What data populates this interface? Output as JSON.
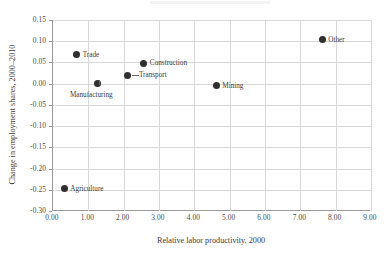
{
  "chart_data": {
    "type": "scatter",
    "title": "",
    "xlabel": "Relative labor productivity, 2000",
    "ylabel": "Change in employment shares, 2000–2010",
    "xlim": [
      0.0,
      9.0
    ],
    "ylim": [
      -0.3,
      0.15
    ],
    "xticks": [
      "0.00",
      "1.00",
      "2.00",
      "3.00",
      "4.00",
      "5.00",
      "6.00",
      "7.00",
      "8.00",
      "9.00"
    ],
    "xtick_values": [
      0,
      1,
      2,
      3,
      4,
      5,
      6,
      7,
      8,
      9
    ],
    "yticks": [
      "0.15",
      "0.10",
      "0.05",
      "0.00",
      "-0.05",
      "-0.10",
      "-0.15",
      "-0.20",
      "-0.25",
      "-0.30"
    ],
    "ytick_values": [
      0.15,
      0.1,
      0.05,
      0.0,
      -0.05,
      -0.1,
      -0.15,
      -0.2,
      -0.25,
      -0.3
    ],
    "grid": true,
    "legend": "none",
    "marker_color": "#2f2f2f",
    "points": [
      {
        "label": "Agriculture",
        "x": 0.35,
        "y": -0.248,
        "label_pos": "right"
      },
      {
        "label": "Trade",
        "x": 0.7,
        "y": 0.068,
        "label_pos": "right"
      },
      {
        "label": "Manufacturing",
        "x": 1.3,
        "y": 0.0,
        "label_pos": "below"
      },
      {
        "label": "Transport",
        "x": 2.15,
        "y": 0.02,
        "label_pos": "right-leader"
      },
      {
        "label": "Construction",
        "x": 2.6,
        "y": 0.048,
        "label_pos": "right"
      },
      {
        "label": "Mining",
        "x": 4.65,
        "y": -0.005,
        "label_pos": "right"
      },
      {
        "label": "Other",
        "x": 7.65,
        "y": 0.103,
        "label_pos": "right"
      }
    ]
  }
}
